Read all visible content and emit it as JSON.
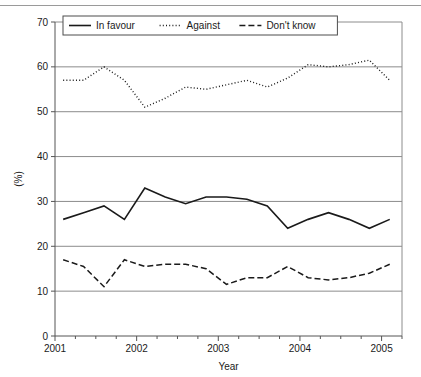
{
  "chart_data": {
    "type": "line",
    "title": "",
    "xlabel": "Year",
    "ylabel": "(%)",
    "xlim": [
      2001.0,
      2005.25
    ],
    "ylim": [
      0,
      70
    ],
    "yticks": [
      0,
      10,
      20,
      30,
      40,
      50,
      60,
      70
    ],
    "xticks": [
      2001,
      2002,
      2003,
      2004,
      2005
    ],
    "xtick_labels": [
      "2001",
      "2002",
      "2003",
      "2004",
      "2005"
    ],
    "ytick_labels": [
      "0",
      "10",
      "20",
      "30",
      "40",
      "50",
      "60",
      "70"
    ],
    "x_minor_ticks": [
      2001.25,
      2001.5,
      2001.75,
      2002.25,
      2002.5,
      2002.75,
      2003.25,
      2003.5,
      2003.75,
      2004.25,
      2004.5,
      2004.75,
      2005.25
    ],
    "grid": "horizontal",
    "legend_position": "top-left-inside",
    "x": [
      2001.1,
      2001.35,
      2001.6,
      2001.85,
      2002.1,
      2002.35,
      2002.6,
      2002.85,
      2003.1,
      2003.35,
      2003.6,
      2003.85,
      2004.1,
      2004.35,
      2004.6,
      2004.85,
      2005.1
    ],
    "series": [
      {
        "name": "In favour",
        "style": "solid",
        "values": [
          26.0,
          27.5,
          29.0,
          26.0,
          33.0,
          31.0,
          29.5,
          31.0,
          31.0,
          30.5,
          29.0,
          24.0,
          26.0,
          27.5,
          26.0,
          24.0,
          26.0
        ]
      },
      {
        "name": "Against",
        "style": "dotted",
        "values": [
          57.0,
          57.0,
          60.0,
          57.0,
          51.0,
          53.0,
          55.5,
          55.0,
          56.0,
          57.0,
          55.5,
          57.5,
          60.5,
          60.0,
          60.5,
          61.5,
          57.0
        ]
      },
      {
        "name": "Don't know",
        "style": "dashed",
        "values": [
          17.0,
          15.5,
          11.0,
          17.0,
          15.5,
          16.0,
          16.0,
          15.0,
          11.5,
          13.0,
          13.0,
          15.5,
          13.0,
          12.5,
          13.0,
          14.0,
          16.0
        ]
      }
    ]
  },
  "legend": {
    "items": [
      {
        "label": "In favour",
        "style": "solid"
      },
      {
        "label": "Against",
        "style": "dotted"
      },
      {
        "label": "Don't know",
        "style": "dashed"
      }
    ]
  }
}
